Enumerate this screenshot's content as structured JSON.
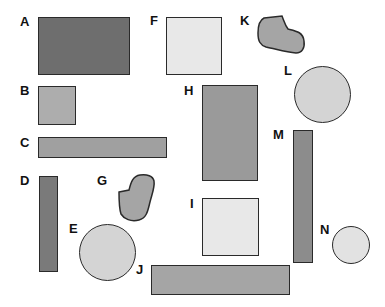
{
  "diagram": {
    "colors": {
      "dark": "#6e6e6e",
      "medium": "#9a9a9a",
      "light": "#b3b3b3",
      "pale": "#e6e6e6",
      "circle": "#d4d4d4",
      "outline": "#2a2a2a"
    },
    "shapes": [
      {
        "label": "A",
        "type": "rectangle",
        "fill": "#6e6e6e"
      },
      {
        "label": "B",
        "type": "square",
        "fill": "#adadad"
      },
      {
        "label": "C",
        "type": "rectangle",
        "fill": "#a0a0a0"
      },
      {
        "label": "D",
        "type": "rectangle",
        "fill": "#7a7a7a"
      },
      {
        "label": "E",
        "type": "circle",
        "fill": "#d4d4d4"
      },
      {
        "label": "F",
        "type": "square",
        "fill": "#e8e8e8"
      },
      {
        "label": "G",
        "type": "irregular",
        "fill": "#a5a5a5"
      },
      {
        "label": "H",
        "type": "rectangle",
        "fill": "#9a9a9a"
      },
      {
        "label": "I",
        "type": "square",
        "fill": "#e8e8e8"
      },
      {
        "label": "J",
        "type": "rectangle",
        "fill": "#a5a5a5"
      },
      {
        "label": "K",
        "type": "irregular",
        "fill": "#a5a5a5"
      },
      {
        "label": "L",
        "type": "circle",
        "fill": "#d4d4d4"
      },
      {
        "label": "M",
        "type": "rectangle",
        "fill": "#8c8c8c"
      },
      {
        "label": "N",
        "type": "circle",
        "fill": "#e2e2e2"
      }
    ]
  }
}
